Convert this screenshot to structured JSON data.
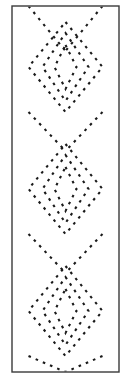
{
  "figure": {
    "width": 131,
    "height": 379,
    "background_color": "#ffffff"
  },
  "frame": {
    "name": "panel-border",
    "x": 12,
    "y": 6,
    "width": 107,
    "height": 366,
    "stroke_color": "#3a3a3a",
    "stroke_width": 1.4,
    "fill_color": "#ffffff"
  },
  "stitch_style": {
    "stroke_color": "#1a1a1a",
    "stroke_width": 2.1,
    "dash_on": 2.6,
    "dash_gap": 5.2,
    "linecap": "butt"
  },
  "chart_data": {
    "type": "line",
    "xlabel": "",
    "ylabel": "",
    "grid": false,
    "legend": null,
    "xlim": [
      12,
      119
    ],
    "ylim": [
      6,
      372
    ],
    "center_x": 65.5,
    "unit_height": 122,
    "unit_centers_y": [
      67,
      189,
      311
    ],
    "diamond_half_widths": [
      37,
      23,
      11
    ],
    "diamond_half_heights": [
      45,
      34,
      22
    ],
    "series": [
      {
        "name": "unit-1-outer-diamond",
        "shape": "diamond",
        "cx": 65.5,
        "cy": 67,
        "half_width": 37,
        "half_height": 45
      },
      {
        "name": "unit-1-middle-diamond",
        "shape": "diamond",
        "cx": 65.5,
        "cy": 67,
        "half_width": 23,
        "half_height": 34
      },
      {
        "name": "unit-1-inner-diamond",
        "shape": "diamond",
        "cx": 65.5,
        "cy": 67,
        "half_width": 11,
        "half_height": 22
      },
      {
        "name": "unit-2-outer-diamond",
        "shape": "diamond",
        "cx": 65.5,
        "cy": 189,
        "half_width": 37,
        "half_height": 45
      },
      {
        "name": "unit-2-middle-diamond",
        "shape": "diamond",
        "cx": 65.5,
        "cy": 189,
        "half_width": 23,
        "half_height": 34
      },
      {
        "name": "unit-2-inner-diamond",
        "shape": "diamond",
        "cx": 65.5,
        "cy": 189,
        "half_width": 11,
        "half_height": 22
      },
      {
        "name": "unit-3-outer-diamond",
        "shape": "diamond",
        "cx": 65.5,
        "cy": 311,
        "half_width": 37,
        "half_height": 45
      },
      {
        "name": "unit-3-middle-diamond",
        "shape": "diamond",
        "cx": 65.5,
        "cy": 311,
        "half_width": 23,
        "half_height": 34
      },
      {
        "name": "unit-3-inner-diamond",
        "shape": "diamond",
        "cx": 65.5,
        "cy": 311,
        "half_width": 11,
        "half_height": 22
      },
      {
        "name": "crossing-strand-top-left",
        "shape": "polyline",
        "points": "28.5,6 65.5,51 65.5,51"
      },
      {
        "name": "crossing-strand-top-right",
        "shape": "polyline",
        "points": "102.5,6 65.5,51"
      },
      {
        "name": "crossing-strand-mid-1-left",
        "shape": "polyline",
        "points": "28.5,112 65.5,151"
      },
      {
        "name": "crossing-strand-mid-1-right",
        "shape": "polyline",
        "points": "102.5,112 65.5,151"
      },
      {
        "name": "crossing-strand-mid-2-left",
        "shape": "polyline",
        "points": "28.5,234 65.5,273"
      },
      {
        "name": "crossing-strand-mid-2-right",
        "shape": "polyline",
        "points": "102.5,234 65.5,273"
      },
      {
        "name": "crossing-strand-bottom-left",
        "shape": "polyline",
        "points": "28.5,356 65.5,372"
      },
      {
        "name": "crossing-strand-bottom-right",
        "shape": "polyline",
        "points": "102.5,356 65.5,372"
      }
    ]
  }
}
